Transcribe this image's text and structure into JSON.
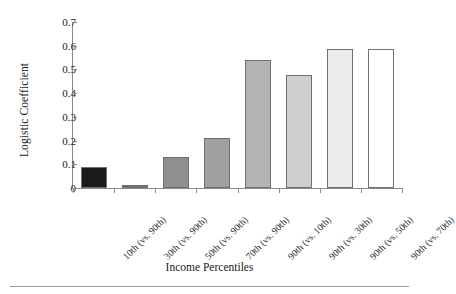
{
  "chart_data": {
    "type": "bar",
    "title": "",
    "xlabel": "Income Percentiles",
    "ylabel": "Logistic Coefficient",
    "categories": [
      "10th (vs. 90th)",
      "30th (vs. 90th)",
      "50th (vs. 90th)",
      "70th (vs. 90th)",
      "90th (vs. 10th)",
      "90th (vs. 30th)",
      "90th (vs. 50th)",
      "90th (vs. 70th)"
    ],
    "values": [
      0.09,
      0.012,
      0.13,
      0.21,
      0.54,
      0.475,
      0.585,
      0.585
    ],
    "bar_colors": [
      "#1a1a1a",
      "#6e6e6e",
      "#8f8f8f",
      "#a0a0a0",
      "#b4b4b4",
      "#cfcfcf",
      "#ebebeb",
      "#ffffff"
    ],
    "ylim": [
      0,
      0.7
    ],
    "yticks": [
      0.7,
      0.6,
      0.5,
      0.4,
      0.3,
      0.2,
      0.1,
      0
    ],
    "ytick_labels": [
      "0.7",
      "0.6",
      "0.5",
      "0.4",
      "0.3",
      "0.2",
      "0.1",
      "0"
    ],
    "grid": false,
    "legend": "none"
  }
}
